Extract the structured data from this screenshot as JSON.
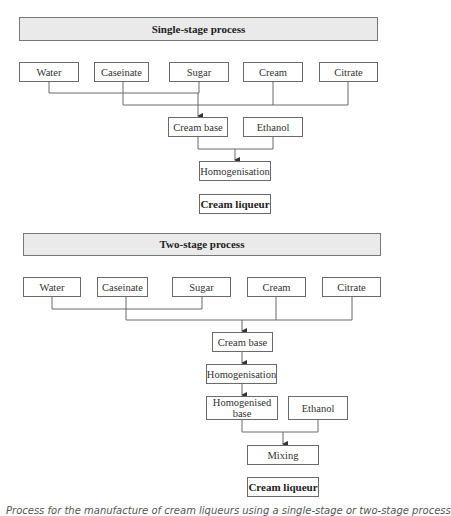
{
  "single_stage": {
    "title": "Single-stage process",
    "inputs": [
      "Water",
      "Caseinate",
      "Sugar",
      "Cream",
      "Citrate"
    ],
    "cream_base": "Cream base",
    "ethanol": "Ethanol",
    "homogenisation": "Homogenisation",
    "product": "Cream liqueur"
  },
  "two_stage": {
    "title": "Two-stage process",
    "inputs": [
      "Water",
      "Caseinate",
      "Sugar",
      "Cream",
      "Citrate"
    ],
    "cream_base": "Cream base",
    "homogenisation": "Homogenisation",
    "homogenised_base": "Homogenised base",
    "ethanol": "Ethanol",
    "mixing": "Mixing",
    "product": "Cream liqueur"
  },
  "caption": "Process for the manufacture of cream liqueurs using a single-stage or two-stage process"
}
